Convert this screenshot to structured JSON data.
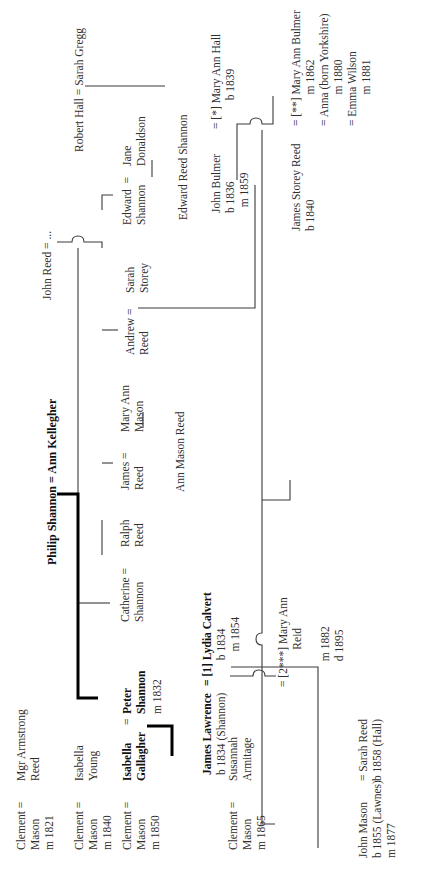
{
  "diagram": {
    "type": "family-tree",
    "orientation": "rotated -90deg (read bottom-to-top)",
    "colors": {
      "line": "#3a3a3a",
      "bold_line": "#000000",
      "text": "#2f2f2f"
    }
  },
  "people": {
    "clement_reed": {
      "left": "Clement =\nMason\nm 1821",
      "right": "Mgr Armstrong\nReed"
    },
    "clement_young": {
      "left": "Clement =\nMason\nm 1840",
      "right": "Isabella\nYoung"
    },
    "clement_gallagher": {
      "left": "Clement =\nMason\nm 1850",
      "right_name": "Isabella\nGallagher"
    },
    "peter": {
      "eq": "=",
      "name": "Peter\nShannon",
      "date": "m 1832"
    },
    "philip": {
      "couple": "Philip Shannon = Ann Kellegher"
    },
    "catherine": {
      "text": "Catherine =\nShannon"
    },
    "ralph": {
      "text": "Ralph\nReed"
    },
    "james_reed": {
      "left": "James =\nReed",
      "right": "Mary Ann\nMason"
    },
    "ann_mason_reed": {
      "text": "Ann Mason Reed"
    },
    "andrew": {
      "left": "Andrew =\nReed",
      "right": "Sarah\nStorey"
    },
    "john_reed": {
      "text": "John Reed = ..."
    },
    "edward": {
      "left": "Edward  =\nShannon",
      "right": "Jane\nDonaldson"
    },
    "edward_reed_shannon": {
      "text": "Edward Reed Shannon"
    },
    "robert_hall": {
      "text": "Robert Hall = Sarah Gregg"
    },
    "john_bulmer": {
      "left": "John Bulmer\nb 1836\n  m 1859",
      "right": "= [*] Mary Ann Hall\n          b 1839"
    },
    "james_storey": {
      "left": "James Storey Reed\nb 1840",
      "right": "= [**] Mary Ann Bulmer\n           m 1862\n= Anna (born Yorkshire)\n           m 1880\n= Emma Wilson\n           m 1881"
    },
    "james_lawrence": {
      "name": "James Lawrence",
      "sub": "b 1834 (Shannon)"
    },
    "lydia": {
      "name": "= [1] Lydia Calvert",
      "sub": "         b 1834\n            m 1854"
    },
    "mary_ann_reid": {
      "text": "= [2***] Mary Ann\n             Reid\n\n         m 1882\n         d 1895"
    },
    "clement_armitage": {
      "left": "Clement =\nMason\nm 1865",
      "right": "Susannah\nArmitage"
    },
    "john_mason": {
      "text": "John Mason\nb 1855 (Lawnes)\nm 1877"
    },
    "sarah_reed": {
      "text": "= Sarah Reed\nb 1858 (Hall)"
    }
  }
}
